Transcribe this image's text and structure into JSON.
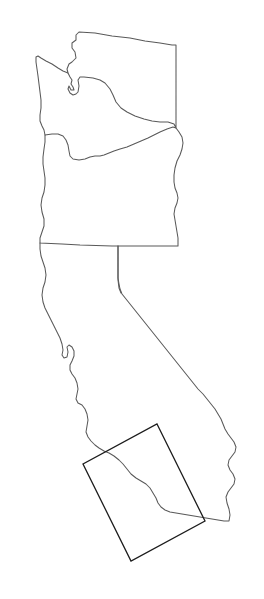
{
  "figure": {
    "kind": "map",
    "background_color": "#ffffff",
    "width": 264,
    "height": 599,
    "alt_text": "Outline map of Washington, Oregon and California with a rotated rectangular annotation box over Southern California"
  },
  "style": {
    "state_outline_color": "#595959",
    "state_outline_width": 1.05,
    "annotation_box_color": "#1c1c1c",
    "annotation_box_width": 1.3
  },
  "regions": [
    {
      "id": "washington",
      "name": "Washington",
      "outline_path": "M 79 32 L 76 35 L 76 40 L 72 43 L 72 48 L 75 52 L 76 58 L 72 62 L 69 64 L 67 69 L 68 73 L 70 77 L 72 80 L 71 84 L 73 87 L 74 90 L 71 90 L 69 86 L 68 89 L 70 93 L 73 95 L 76 94 L 78 92 L 79 86 L 78 80 L 80 77 L 84 77 L 93 78 L 100 80 L 105 83 L 110 89 L 113 95 L 116 102 L 121 108 L 127 112 L 135 116 L 144 119 L 152 121 L 160 122 L 168 122 L 174 124 L 176 128 L 176 45 L 172 45 L 160 43 L 145 41 L 130 38 L 112 36 L 95 33 Z"
    },
    {
      "id": "washington-olympic-coast",
      "name": "Washington Olympic Peninsula and Pacific coast",
      "outline_path": "M 68 73 L 63 71 L 58 68 L 52 64 L 46 61 L 41 58 L 38 56 L 36 57 L 36 62 L 37 69 L 38 76 L 39 84 L 40 92 L 41 100 L 41 108 L 40 115 L 40 121 L 42 126 L 44 130 L 45 135"
    },
    {
      "id": "oregon",
      "name": "Oregon",
      "outline_path": "M 45 135 L 52 134 L 58 134 L 63 136 L 66 140 L 68 145 L 69 151 L 70 156 L 73 159 L 79 160 L 85 159 L 90 157 L 95 156 L 100 156 L 104 155 L 109 153 L 114 151 L 120 149 L 127 147 L 134 144 L 141 141 L 148 138 L 154 135 L 160 132 L 167 129 L 173 127 L 176 128 L 179 132 L 182 137 L 183 143 L 182 149 L 180 155 L 177 161 L 175 168 L 174 175 L 174 182 L 175 188 L 177 193 L 178 198 L 177 203 L 175 208 L 174 214 L 175 220 L 176 226 L 177 232 L 178 238 L 178 244 L 178 246 L 112 246 L 80 245 L 62 244 L 40 243 L 40 238 L 42 232 L 44 226 L 44 219 L 42 212 L 41 205 L 42 198 L 44 192 L 45 185 L 45 178 L 44 171 L 43 164 L 43 157 L 44 149 L 45 142 Z"
    },
    {
      "id": "california",
      "name": "California",
      "outline_path": "M 40 243 L 40 249 L 41 256 L 43 262 L 45 268 L 46 275 L 45 282 L 43 288 L 42 295 L 43 302 L 45 308 L 48 314 L 51 320 L 54 326 L 57 332 L 60 338 L 62 344 L 63 350 L 62 355 L 64 358 L 67 357 L 68 352 L 67 347 L 69 345 L 72 347 L 74 351 L 74 356 L 72 361 L 70 365 L 70 370 L 72 374 L 75 378 L 77 383 L 78 389 L 77 394 L 76 399 L 78 403 L 82 405 L 85 409 L 87 414 L 88 420 L 87 426 L 86 432 L 88 437 L 91 441 L 95 445 L 99 448 L 104 451 L 109 453 L 114 456 L 119 460 L 123 464 L 127 469 L 131 474 L 136 478 L 141 481 L 146 484 L 150 488 L 153 493 L 156 498 L 158 503 L 161 507 L 165 510 L 170 512 L 176 513 L 182 514 L 188 515 L 194 516 L 200 517 L 206 518 L 212 519 L 218 520 L 224 521 L 229 521 L 230 515 L 229 509 L 227 503 L 226 497 L 228 492 L 231 488 L 234 484 L 235 479 L 233 474 L 230 470 L 228 465 L 229 460 L 232 456 L 235 452 L 236 447 L 234 442 L 231 438 L 228 434 L 225 429 L 223 424 L 221 419 L 218 414 L 215 409 L 211 404 L 207 399 L 203 394 L 198 389 L 194 384 L 190 379 L 186 374 L 182 369 L 178 364 L 174 359 L 170 354 L 166 349 L 162 344 L 158 339 L 154 334 L 150 329 L 146 324 L 142 319 L 138 314 L 134 309 L 130 304 L 126 299 L 122 294 L 120 289 L 119 284 L 118 278 L 118 272 L 118 266 L 118 260 L 118 254 L 118 248 L 118 246"
    },
    {
      "id": "california-nevada-stem",
      "name": "California Nevada vertical border stem",
      "outline_path": "M 118 246 L 118 252 L 118 260 L 118 270 L 118 280 L 119 288 L 121 293"
    }
  ],
  "annotations": [
    {
      "id": "roi-box",
      "name": "rotated-region-of-interest-box",
      "shape": "rotated-rectangle",
      "corners": [
        {
          "label": "top-right",
          "x": 157,
          "y": 424
        },
        {
          "label": "right",
          "x": 205,
          "y": 521
        },
        {
          "label": "bottom",
          "x": 131,
          "y": 561
        },
        {
          "label": "left",
          "x": 83,
          "y": 464
        }
      ],
      "rotation_degrees": 63.7,
      "stroke_color": "#1c1c1c",
      "fill": "none"
    }
  ]
}
